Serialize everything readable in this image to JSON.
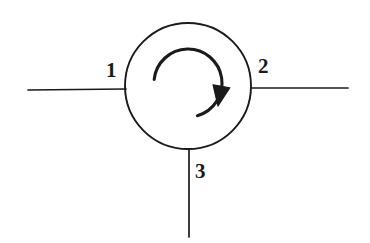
{
  "figure": {
    "name": "three-port-circulator-symbol",
    "background_color": "#ffffff",
    "stroke_color": "#1a1a1a",
    "fill_color": "#1a1a1a"
  },
  "body": {
    "shape": "circle",
    "center_x": 188,
    "center_y": 86,
    "radius": 63,
    "stroke_width": 1.9
  },
  "circulation_arrow": {
    "direction": "clockwise",
    "arc_center_x": 188,
    "arc_center_y": 83,
    "arc_radius": 34,
    "arc_start_angle_deg": 186,
    "arc_end_angle_deg": 74,
    "stroke_width": 3.1,
    "arrowhead": {
      "tip_x": 218,
      "tip_y": 106,
      "width": 17,
      "length": 20,
      "angle_deg": 100
    }
  },
  "ports": [
    {
      "id": "port-1",
      "label": "1",
      "side": "left",
      "lead_x1": 28,
      "lead_y1": 90,
      "lead_x2": 126,
      "lead_y2": 89,
      "label_x": 106,
      "label_y": 60
    },
    {
      "id": "port-2",
      "label": "2",
      "side": "right",
      "lead_x1": 251,
      "lead_y1": 88,
      "lead_x2": 348,
      "lead_y2": 88,
      "label_x": 258,
      "label_y": 56
    },
    {
      "id": "port-3",
      "label": "3",
      "side": "bottom",
      "lead_x1": 189,
      "lead_y1": 150,
      "lead_x2": 189,
      "lead_y2": 237,
      "label_x": 195,
      "label_y": 161
    }
  ],
  "lead_stroke_width": 1.7
}
